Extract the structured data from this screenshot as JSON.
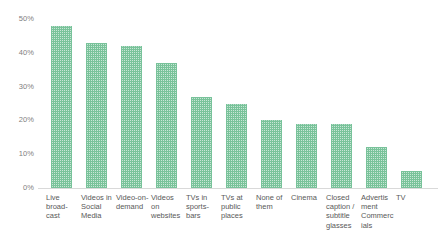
{
  "chart_data": {
    "type": "bar",
    "title": "",
    "subtitle": "",
    "xlabel": "",
    "ylabel": "",
    "ylim": [
      0,
      50
    ],
    "yunit": "%",
    "grid": false,
    "legend": false,
    "legend_position": "none",
    "bar_color": "#6fbf92",
    "bar_pattern": "checkered-dotted",
    "axis_color": "#d9d9d9",
    "tick_label_color": "#808080",
    "category_label_color": "#595959",
    "y_ticks": [
      "0%",
      "10%",
      "20%",
      "30%",
      "40%",
      "50%"
    ],
    "y_tick_values": [
      0,
      10,
      20,
      30,
      40,
      50
    ],
    "categories": [
      "Live broad-cast",
      "Videos in Social Media",
      "Video-on-demand",
      "Videos on websites",
      "TVs in sports-bars",
      "TVs at public places",
      "None of them",
      "Cinema",
      "Closed caption / subtitle glasses",
      "Advertisment Commercials",
      "TV"
    ],
    "values": [
      48,
      43,
      42,
      37,
      27,
      25,
      20,
      19,
      19,
      12,
      5
    ]
  }
}
